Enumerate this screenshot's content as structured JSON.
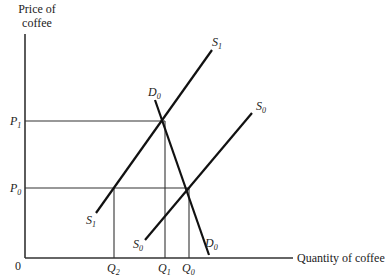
{
  "diagram": {
    "type": "supply-demand",
    "y_axis_label": [
      "Price of",
      "coffee"
    ],
    "x_axis_label": "Quantity of coffee",
    "origin_label": "0",
    "price_levels": [
      {
        "name": "P",
        "sub": "1",
        "y": 121
      },
      {
        "name": "P",
        "sub": "0",
        "y": 188
      }
    ],
    "quantity_levels": [
      {
        "name": "Q",
        "sub": "2",
        "x": 114
      },
      {
        "name": "Q",
        "sub": "1",
        "x": 165
      },
      {
        "name": "Q",
        "sub": "0",
        "x": 189
      }
    ],
    "curves": [
      {
        "id": "S1",
        "name": "S",
        "sub": "1",
        "kind": "supply",
        "from": [
          96,
          213
        ],
        "to": [
          212,
          50
        ]
      },
      {
        "id": "S0",
        "name": "S",
        "sub": "0",
        "kind": "supply",
        "from": [
          145,
          240
        ],
        "to": [
          252,
          113
        ]
      },
      {
        "id": "D0",
        "name": "D",
        "sub": "0",
        "kind": "demand",
        "from": [
          155,
          100
        ],
        "to": [
          209,
          255
        ]
      }
    ],
    "equilibria": [
      {
        "label": "S1 x D0",
        "price": "P1",
        "quantity": "Q1"
      },
      {
        "label": "S0 x D0",
        "price": "P0",
        "quantity": "Q0"
      },
      {
        "label": "S1 at P0",
        "price": "P0",
        "quantity": "Q2"
      }
    ]
  }
}
